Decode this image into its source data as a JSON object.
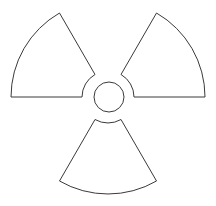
{
  "symbol": {
    "name": "radiation-trefoil",
    "stroke_color": "#3a3a3a",
    "fill_color": "#ffffff",
    "background": "#ffffff",
    "center": [
      108,
      97
    ],
    "outer_radius": 97,
    "inner_radius": 26,
    "core_radius": 15,
    "blades": [
      "upper-left",
      "upper-right",
      "bottom"
    ]
  }
}
